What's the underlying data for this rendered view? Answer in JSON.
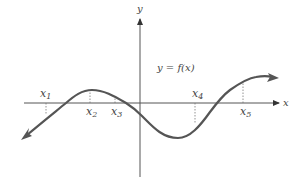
{
  "diagram": {
    "title": "",
    "function_label": "y = f(x)",
    "axes": {
      "x_label": "x",
      "y_label": "y"
    },
    "points": [
      {
        "name": "x",
        "sub": "1"
      },
      {
        "name": "x",
        "sub": "2"
      },
      {
        "name": "x",
        "sub": "3"
      },
      {
        "name": "x",
        "sub": "4"
      },
      {
        "name": "x",
        "sub": "5"
      }
    ],
    "colors": {
      "curve": "#555555",
      "axis": "#555555",
      "dashed": "#777777",
      "text": "#444444"
    }
  }
}
